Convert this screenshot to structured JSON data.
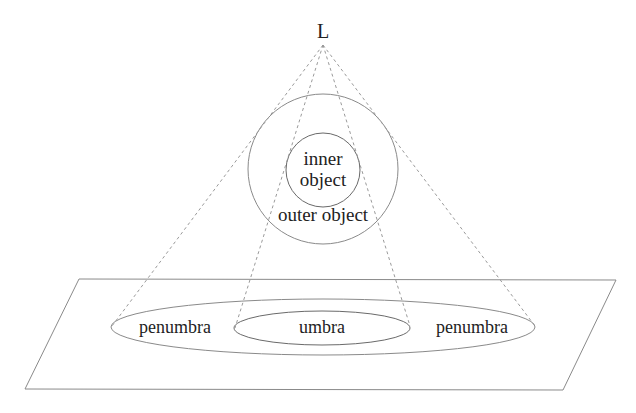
{
  "diagram": {
    "light_label": "L",
    "inner_object": [
      "inner",
      "object"
    ],
    "outer_object_label": "outer object",
    "umbra_label": "umbra",
    "penumbra_left_label": "penumbra",
    "penumbra_right_label": "penumbra"
  },
  "colors": {
    "line": "#8a8a8a",
    "dash": "#9a9a9a",
    "text": "#222222",
    "background": "#ffffff"
  }
}
